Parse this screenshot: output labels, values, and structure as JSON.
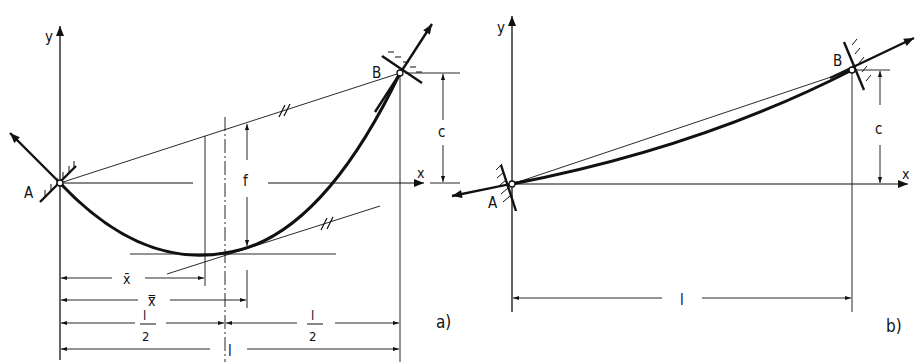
{
  "figure": {
    "panel_a": {
      "caption": "a)",
      "axis_x": "x",
      "axis_y": "y",
      "point_a": "A",
      "point_b": "B",
      "dim_c": "c",
      "dim_f": "f",
      "dim_xbar": "x̄",
      "dim_xdbar": "x̿",
      "dim_half_num": "l",
      "dim_half_den": "2",
      "dim_l": "l",
      "parallel_mark": "//"
    },
    "panel_b": {
      "caption": "b)",
      "axis_x": "x",
      "axis_y": "y",
      "point_a": "A",
      "point_b": "B",
      "dim_c": "c",
      "dim_l": "l"
    },
    "colors": {
      "ink": "#111111",
      "background": "#ffffff"
    }
  }
}
